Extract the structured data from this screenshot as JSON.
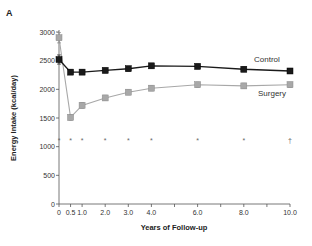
{
  "panel_label": "A",
  "chart_data": {
    "type": "line",
    "title": "",
    "xlabel": "Years of Follow-up",
    "ylabel": "Energy Intake (kcal/day)",
    "xlim": [
      0,
      10
    ],
    "ylim": [
      0,
      3000
    ],
    "x_ticks": [
      {
        "value": 0,
        "label": "0"
      },
      {
        "value": 0.5,
        "label": "0.5"
      },
      {
        "value": 1.0,
        "label": "1.0"
      },
      {
        "value": 2.0,
        "label": "2.0"
      },
      {
        "value": 3.0,
        "label": "3.0"
      },
      {
        "value": 4.0,
        "label": "4.0"
      },
      {
        "value": 5.0,
        "label": ""
      },
      {
        "value": 6.0,
        "label": "6.0"
      },
      {
        "value": 7.0,
        "label": ""
      },
      {
        "value": 8.0,
        "label": "8.0"
      },
      {
        "value": 9.0,
        "label": ""
      },
      {
        "value": 10.0,
        "label": "10.0"
      }
    ],
    "y_ticks": [
      0,
      500,
      1000,
      1500,
      2000,
      2500,
      3000
    ],
    "grid": false,
    "legend_position": "inline labels at right",
    "x": [
      0,
      0.5,
      1.0,
      2.0,
      3.0,
      4.0,
      6.0,
      8.0,
      10.0
    ],
    "series": [
      {
        "name": "Control",
        "marker": "black square",
        "color": "#1a1a1a",
        "values": [
          2520,
          2300,
          2300,
          2330,
          2360,
          2410,
          2400,
          2350,
          2320
        ],
        "error": [
          80,
          40,
          40,
          40,
          40,
          40,
          40,
          40,
          40
        ]
      },
      {
        "name": "Surgery",
        "marker": "gray square",
        "color": "#a8a8a8",
        "values": [
          2900,
          1510,
          1720,
          1850,
          1950,
          2020,
          2080,
          2060,
          2080
        ],
        "error": [
          90,
          50,
          50,
          45,
          45,
          45,
          45,
          45,
          45
        ]
      }
    ],
    "annotations": {
      "significance_y": 1120,
      "markers": [
        {
          "x": 0,
          "symbol": "*"
        },
        {
          "x": 0.5,
          "symbol": "*"
        },
        {
          "x": 1.0,
          "symbol": "*"
        },
        {
          "x": 2.0,
          "symbol": "*"
        },
        {
          "x": 3.0,
          "symbol": "*"
        },
        {
          "x": 4.0,
          "symbol": "*"
        },
        {
          "x": 6.0,
          "symbol": "*"
        },
        {
          "x": 8.0,
          "symbol": "*"
        },
        {
          "x": 10.0,
          "symbol": "†"
        }
      ]
    }
  }
}
